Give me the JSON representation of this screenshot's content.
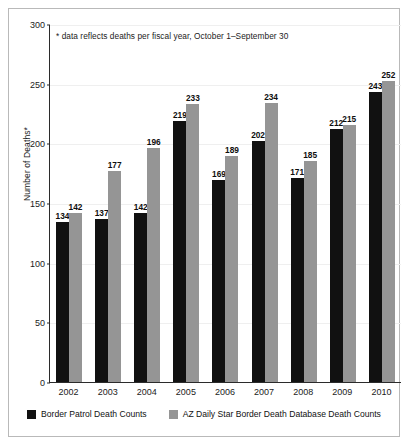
{
  "chart_data": {
    "type": "bar",
    "title": "",
    "subtitle": "",
    "xlabel": "",
    "ylabel": "Number of Deaths*",
    "ylim": [
      0,
      300
    ],
    "yticks": [
      0,
      50,
      100,
      150,
      200,
      250,
      300
    ],
    "grid": true,
    "legend_position": "bottom",
    "categories": [
      "2002",
      "2003",
      "2004",
      "2005",
      "2006",
      "2007",
      "2008",
      "2009",
      "2010"
    ],
    "series": [
      {
        "name": "Border Patrol Death Counts",
        "color": "#111111",
        "values": [
          134,
          137,
          142,
          219,
          169,
          202,
          171,
          212,
          243
        ]
      },
      {
        "name": "AZ Daily Star Border Death Database Death Counts",
        "color": "#959595",
        "values": [
          142,
          177,
          196,
          233,
          189,
          234,
          185,
          215,
          252
        ]
      }
    ],
    "annotations": [
      "* data reflects deaths per fiscal year, October 1–September 30"
    ]
  }
}
